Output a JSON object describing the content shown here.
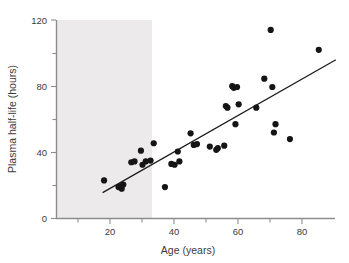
{
  "figure": {
    "title": "",
    "background_color": "#ffffff",
    "shade_color": "#eceaea"
  },
  "chart_data": {
    "type": "scatter",
    "title": "",
    "subtitle": "",
    "xlabel": "Age (years)",
    "ylabel": "Plasma half-life (hours)",
    "xlim": [
      0,
      88
    ],
    "ylim": [
      0,
      120
    ],
    "grid": false,
    "legend": null,
    "x_major_ticks": [
      20,
      40,
      60,
      80
    ],
    "x_minor_ticks": [
      10,
      30,
      50,
      70
    ],
    "x_tick_labels": [
      "20",
      "40",
      "60",
      "80"
    ],
    "y_major_ticks": [
      0,
      40,
      80,
      120
    ],
    "y_minor_ticks": [
      20,
      60,
      100
    ],
    "y_tick_labels": [
      "0",
      "40",
      "80",
      "120"
    ],
    "point_color": "#151515",
    "point_radius": 3.1,
    "series": [
      {
        "name": "Subjects",
        "marker": "filled-circle",
        "x": [
          15,
          19.5,
          20,
          20.5,
          21,
          23.5,
          24.5,
          26.5,
          27,
          28,
          29.5,
          30.5,
          34,
          36,
          37,
          38,
          38.5,
          42,
          43,
          44,
          48,
          50,
          50.5,
          52.5,
          53,
          53.5,
          55,
          55.5,
          56,
          56.5,
          57,
          62.5,
          65,
          67,
          67.5,
          68,
          68.5,
          73,
          82
        ],
        "y": [
          23,
          19,
          19.5,
          18,
          20.5,
          34,
          34.5,
          41,
          32.5,
          34.5,
          35,
          45.5,
          19,
          33,
          32.5,
          40.5,
          34.5,
          51.5,
          44.5,
          45,
          43.5,
          41.5,
          42.5,
          44,
          68,
          67,
          80,
          79,
          57,
          79.5,
          69,
          67,
          84.5,
          114,
          79.5,
          52,
          57,
          48,
          102
        ]
      }
    ],
    "fit_line": {
      "name": "Least-squares regression line",
      "x_start": 14.7,
      "y_start": 15.8,
      "x_end": 87.2,
      "y_end": 95.8
    }
  },
  "axes": {
    "x_axis_name": "x-axis",
    "y_axis_name": "y-axis"
  }
}
